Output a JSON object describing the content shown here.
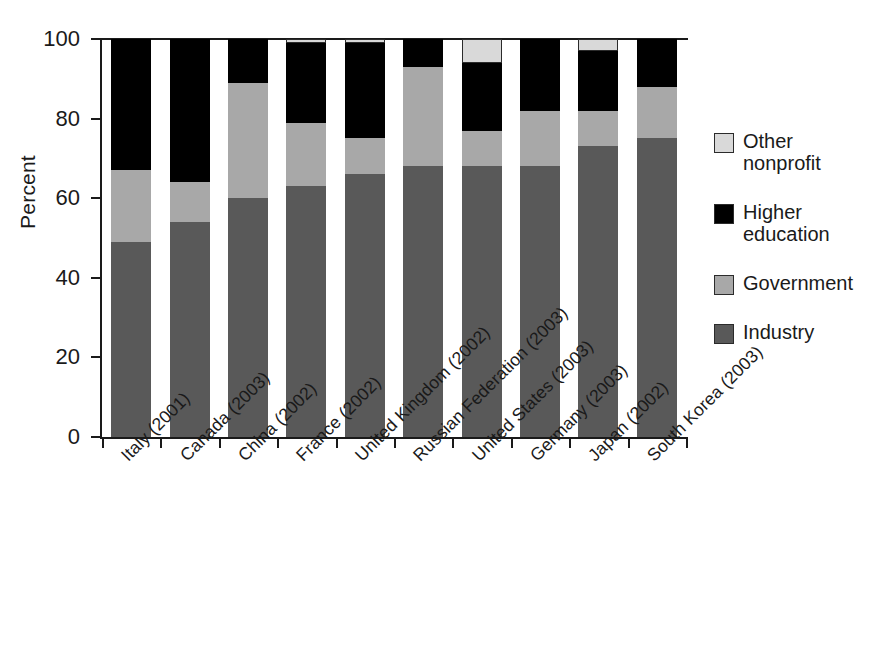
{
  "chart_data": {
    "type": "bar",
    "subtype": "stacked-bar-100",
    "title": "",
    "xlabel": "",
    "ylabel": "Percent",
    "ylim": [
      0,
      100
    ],
    "yticks": [
      0,
      20,
      40,
      60,
      80,
      100
    ],
    "ytick_labels": [
      "0",
      "20",
      "40",
      "60",
      "80",
      "100"
    ],
    "grid": false,
    "legend_position": "right",
    "categories": [
      "Italy (2001)",
      "Canada (2003)",
      "China (2002)",
      "France (2002)",
      "United Kingdom (2002)",
      "Russian Federation (2003)",
      "United States (2003)",
      "Germany (2003)",
      "Japan (2002)",
      "South Korea (2003)"
    ],
    "series": [
      {
        "name": "Industry",
        "color": "#595959",
        "values": [
          49,
          54,
          60,
          63,
          66,
          68,
          68,
          68,
          73,
          75
        ]
      },
      {
        "name": "Government",
        "color": "#a8a8a8",
        "values": [
          18,
          10,
          29,
          16,
          9,
          25,
          9,
          14,
          9,
          13
        ]
      },
      {
        "name": "Higher education",
        "color": "#000000",
        "values": [
          33,
          36,
          11,
          20,
          24,
          7,
          17,
          18,
          15,
          12
        ]
      },
      {
        "name": "Other nonprofit",
        "color": "#d9d9d9",
        "values": [
          0,
          0,
          0,
          1,
          1,
          0,
          6,
          0,
          3,
          0
        ]
      }
    ],
    "cumulative_tops": {
      "industry": [
        49,
        54,
        60,
        63,
        66,
        68,
        68,
        68,
        73,
        75
      ],
      "government": [
        67,
        64,
        89,
        79,
        75,
        93,
        77,
        82,
        82,
        88
      ],
      "higher": [
        100,
        100,
        100,
        99,
        99,
        100,
        94,
        100,
        97,
        100
      ],
      "other": [
        100,
        100,
        100,
        100,
        100,
        100,
        100,
        100,
        100,
        100
      ]
    }
  },
  "legend": {
    "items": [
      {
        "label": "Other\nnonprofit",
        "color": "#d9d9d9",
        "key": "other-nonprofit"
      },
      {
        "label": "Higher\neducation",
        "color": "#000000",
        "key": "higher-education"
      },
      {
        "label": "Government",
        "color": "#a8a8a8",
        "key": "government"
      },
      {
        "label": "Industry",
        "color": "#595959",
        "key": "industry"
      }
    ]
  },
  "axes": {
    "y_title": "Percent"
  }
}
